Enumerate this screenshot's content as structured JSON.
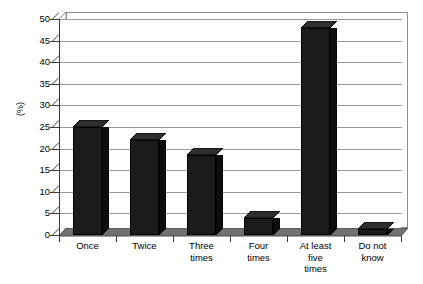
{
  "chart_data": {
    "type": "bar",
    "title": "",
    "subtitle": "",
    "xlabel": "",
    "ylabel": "(%)",
    "ylim": [
      0,
      50
    ],
    "ytick_step": 5,
    "yticks": [
      50,
      45,
      40,
      35,
      30,
      25,
      20,
      15,
      10,
      5,
      0
    ],
    "grid": true,
    "legend": false,
    "legend_position": "none",
    "style_3d": true,
    "categories": [
      "Once",
      "Twice",
      "Three times",
      "Four times",
      "At least five times",
      "Do not know"
    ],
    "category_lines": [
      [
        "Once"
      ],
      [
        "Twice"
      ],
      [
        "Three",
        "times"
      ],
      [
        "Four",
        "times"
      ],
      [
        "At least",
        "five",
        "times"
      ],
      [
        "Do not",
        "know"
      ]
    ],
    "values": [
      25,
      22,
      18.5,
      4,
      48,
      1.5
    ],
    "series": [
      {
        "name": "",
        "values": [
          25,
          22,
          18.5,
          4,
          48,
          1.5
        ]
      }
    ],
    "colors": {
      "bar_front": "#1b1b1b",
      "bar_side": "#0d0d0d",
      "bar_top": "#2e2e2e",
      "gridline": "#9a9a9a",
      "axis": "#3a3a3a",
      "plot_background": "#ffffff",
      "floor": "#6e6e6e",
      "text": "#000000"
    }
  }
}
